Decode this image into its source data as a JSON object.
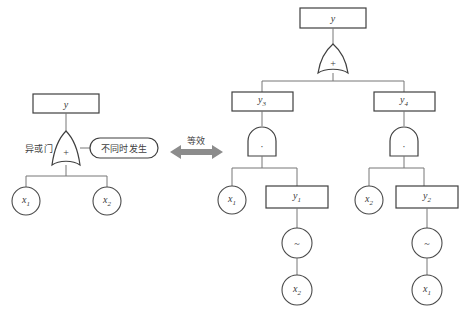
{
  "diagram": {
    "equivalence_label": "等效",
    "colors": {
      "stroke": "#3f3f3f",
      "stroke_light": "#6e6e6e",
      "arrow": "#8c8c8c",
      "background": "#ffffff"
    },
    "left_tree": {
      "top_box": {
        "label": "y"
      },
      "gate": {
        "symbol": "+",
        "type": "xor-gate"
      },
      "gate_annotation_left": "异或门",
      "gate_annotation_right": "不同时发生",
      "leaves": [
        {
          "label": "x",
          "sub": "1"
        },
        {
          "label": "x",
          "sub": "2"
        }
      ]
    },
    "right_tree": {
      "top_box": {
        "label": "y"
      },
      "or_gate": {
        "symbol": "+",
        "type": "or-gate"
      },
      "mid_boxes": [
        {
          "label": "y",
          "sub": "3"
        },
        {
          "label": "y",
          "sub": "4"
        }
      ],
      "and_gates": [
        {
          "symbol": "·",
          "type": "and-gate"
        },
        {
          "symbol": "·",
          "type": "and-gate"
        }
      ],
      "branch_left": {
        "circle": {
          "label": "x",
          "sub": "1"
        },
        "box": {
          "label": "y",
          "sub": "1"
        },
        "not_gate": {
          "symbol": "~",
          "type": "not-gate"
        },
        "leaf": {
          "label": "x",
          "sub": "2"
        }
      },
      "branch_right": {
        "circle": {
          "label": "x",
          "sub": "2"
        },
        "box": {
          "label": "y",
          "sub": "2"
        },
        "not_gate": {
          "symbol": "~",
          "type": "not-gate"
        },
        "leaf": {
          "label": "x",
          "sub": "1"
        }
      }
    }
  }
}
